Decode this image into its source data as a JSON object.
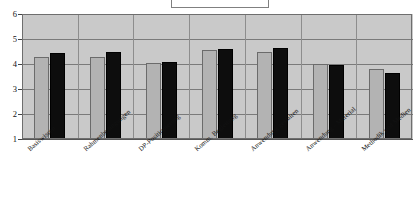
{
  "chart_data": {
    "type": "bar",
    "title": "",
    "subtitle": "",
    "xlabel": "",
    "ylabel": "",
    "ylim": [
      1,
      6
    ],
    "yticks": [
      1,
      2,
      3,
      4,
      5,
      6
    ],
    "ytick_labels": [
      "1",
      "2",
      "3",
      "4",
      "5",
      "6"
    ],
    "grid": true,
    "legend": {
      "visible": true,
      "position": "top-center",
      "entries": []
    },
    "categories": [
      "Basiswissen",
      "Rahmenbedingungen",
      "DP-Positionierung",
      "Komm. Begleitung",
      "Anwendung gestalten",
      "Anwendung - Material",
      "Methodik und Medien"
    ],
    "series": [
      {
        "name": "Serie 1",
        "color": "#b3b3b3",
        "values": [
          4.3,
          4.3,
          4.05,
          4.55,
          4.48,
          4.0,
          3.8
        ]
      },
      {
        "name": "Serie 2",
        "color": "#0d0d0d",
        "values": [
          4.46,
          4.47,
          4.08,
          4.6,
          4.64,
          3.96,
          3.66
        ]
      }
    ]
  },
  "colors": {
    "plot_background": "#c9c9c9",
    "gridline": "#7a7a7a",
    "axis": "#555555",
    "series_1": "#b3b3b3",
    "series_2": "#0d0d0d",
    "page_background": "#ffffff"
  }
}
